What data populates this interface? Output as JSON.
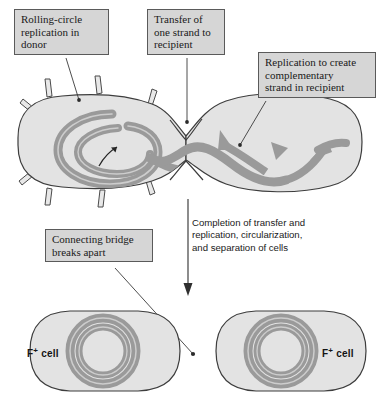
{
  "figure": {
    "type": "biology-process-diagram"
  },
  "colors": {
    "cell_fill": "#e3e3e3",
    "cell_outline": "#3d3d3d",
    "dna_strand": "#9a9a9a",
    "dna_highlight": "#c9c9c9",
    "callout_fill": "#d6d6d6",
    "callout_border": "#5a5a5a",
    "text": "#1a1a1a",
    "leader_line": "#3a3a3a",
    "page_background": "#ffffff"
  },
  "callouts": [
    {
      "id": "rolling-circle",
      "text": "Rolling-circle\nreplication in\ndonor"
    },
    {
      "id": "transfer",
      "text": "Transfer of\none strand to\nrecipient"
    },
    {
      "id": "replication",
      "text": "Replication to create\ncomplementary\nstrand in recipient"
    },
    {
      "id": "bridge",
      "text": "Connecting bridge\nbreaks apart"
    }
  ],
  "process_note": {
    "text": "Completion of transfer and\nreplication, circularization,\nand separation of cells"
  },
  "cells": {
    "top": {
      "donor_label": "donor",
      "recipient_label": "recipient"
    },
    "bottom_left": {
      "caption_main": "F",
      "caption_superscript": "+",
      "caption_suffix": " cell"
    },
    "bottom_right": {
      "caption_main": "F",
      "caption_superscript": "+",
      "caption_suffix": " cell"
    }
  },
  "icons": {
    "pilus": "pilus-icon",
    "down_arrow": "down-arrow-icon",
    "rotation_arrow": "rotation-arrow-icon",
    "strand_arrowhead": "strand-arrowhead-icon"
  }
}
